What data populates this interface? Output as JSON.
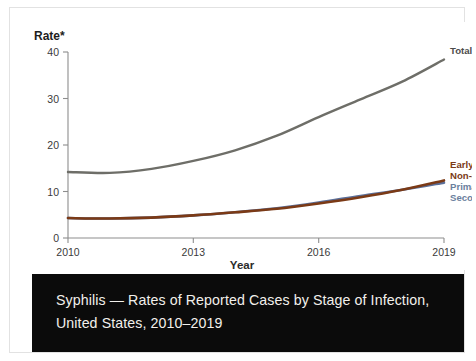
{
  "caption": {
    "text": "Syphilis — Rates of Reported Cases by Stage of Infection, United States, 2010–2019",
    "background": "#0b0b0b",
    "color": "#f2f0ec"
  },
  "chart_data": {
    "type": "line",
    "title": "Syphilis — Rates of Reported Cases by Stage of Infection, United States, 2010–2019",
    "xlabel": "Year",
    "ylabel": "Rate*",
    "ylim": [
      0,
      42
    ],
    "xlim": [
      2010,
      2019
    ],
    "yticks": [
      "0",
      "10",
      "20",
      "30",
      "40"
    ],
    "ytick_values": [
      0,
      10,
      20,
      30,
      40
    ],
    "xticks": [
      "2010",
      "2013",
      "2016",
      "2019"
    ],
    "xtick_values": [
      2010,
      2013,
      2016,
      2019
    ],
    "grid": false,
    "legend": "inline-right",
    "x": [
      2010,
      2011,
      2012,
      2013,
      2014,
      2015,
      2016,
      2017,
      2018,
      2019
    ],
    "series": [
      {
        "name": "Total Syphilis",
        "label": "Total Syphilis",
        "color": "#6e6e68",
        "values": [
          14.9,
          14.7,
          15.6,
          17.4,
          19.8,
          23.1,
          27.3,
          31.3,
          35.3,
          40.3
        ]
      },
      {
        "name": "Early Non-Primary Non-Secondary",
        "label_line1": "Early Non-Primary",
        "label_line2": "Non-Secondary",
        "color": "#7b3a16",
        "values": [
          4.5,
          4.4,
          4.6,
          5.1,
          5.8,
          6.6,
          7.8,
          9.2,
          10.9,
          13.0
        ]
      },
      {
        "name": "Primary and Secondary",
        "label_line1": "Primary and",
        "label_line2": "Secondary",
        "color": "#5b6f99",
        "values": [
          4.5,
          4.4,
          4.6,
          5.1,
          5.8,
          6.7,
          8.0,
          9.5,
          10.9,
          12.5
        ]
      }
    ]
  }
}
